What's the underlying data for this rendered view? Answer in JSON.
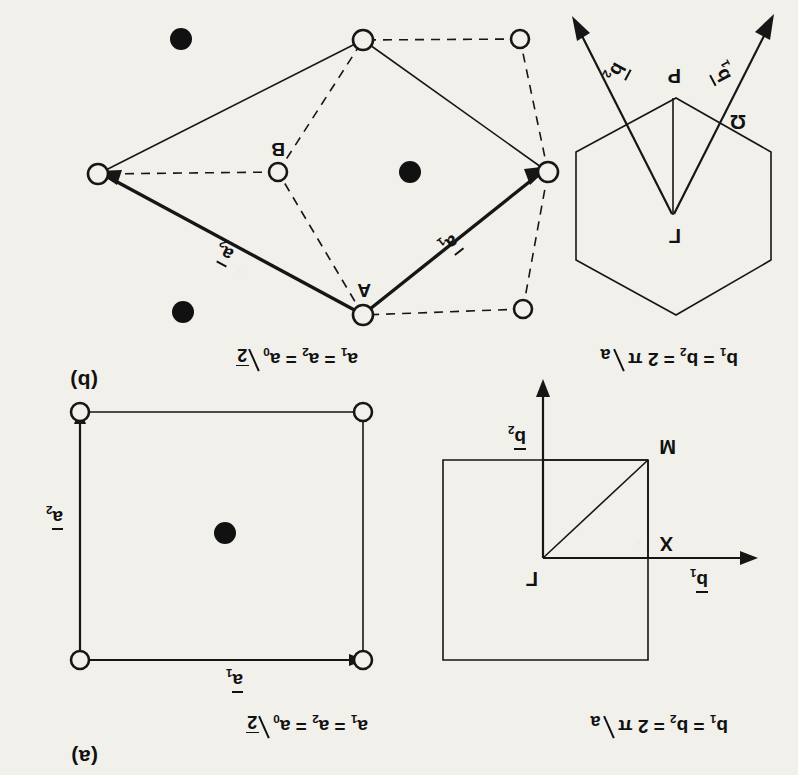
{
  "figure": {
    "orientation": "rotated-180",
    "ink_color": "#161616",
    "paper_color": "#f1f0eb"
  },
  "panels": [
    {
      "id": "a",
      "label": "(a)",
      "real_space": {
        "equation_plain": "a1 = a2 = a0/√2",
        "eq_lhs": "a",
        "eq_sub1": "1",
        "eq_eq1": " = a",
        "eq_sub2": "2",
        "eq_eq2": " = a",
        "eq_sub3": "0",
        "frac_num": "2",
        "frac_den": "",
        "radicand": "2",
        "vectors": [
          {
            "name": "a1",
            "label_base": "a",
            "label_sub": "1",
            "direction": "left"
          },
          {
            "name": "a2",
            "label_base": "a",
            "label_sub": "2",
            "direction": "down"
          }
        ],
        "atoms": {
          "open_count": 4,
          "filled_count": 1,
          "description": "square primitive cell, corner atoms open, centre atom filled"
        }
      },
      "brillouin_zone": {
        "equation_plain": "b1 = b2 = 2π/a",
        "eq_lhs": "b",
        "eq_sub1": "1",
        "eq_eq1": " = b",
        "eq_sub2": "2",
        "eq_eq2": " = 2 π",
        "eq_den": "a",
        "shape": "square",
        "symmetry_points": [
          {
            "name": "gamma",
            "label": "Γ"
          },
          {
            "name": "x",
            "label": "X"
          },
          {
            "name": "m",
            "label": "M"
          }
        ],
        "vectors": [
          {
            "name": "b1",
            "label_base": "b",
            "label_sub": "1",
            "direction": "left"
          },
          {
            "name": "b2",
            "label_base": "b",
            "label_sub": "2",
            "direction": "down"
          }
        ]
      }
    },
    {
      "id": "b",
      "label": "(b)",
      "real_space": {
        "equation_plain": "a1 = a2 = a0/√2",
        "eq_lhs": "a",
        "eq_sub1": "1",
        "eq_eq1": " = a",
        "eq_sub2": "2",
        "eq_eq2": " = a",
        "eq_sub3": "0",
        "radicand": "2",
        "vectors": [
          {
            "name": "a1",
            "label_base": "a",
            "label_sub": "1",
            "direction": "upper-right"
          },
          {
            "name": "a2",
            "label_base": "a",
            "label_sub": "2",
            "direction": "lower-right"
          }
        ],
        "atom_labels": [
          {
            "name": "atom-a",
            "label": "A"
          },
          {
            "name": "atom-b",
            "label": "B"
          }
        ],
        "atoms": {
          "open_count": 7,
          "filled_count": 3,
          "description": "rhombic primitive cell with A and B open atoms and filled second-layer atoms"
        }
      },
      "brillouin_zone": {
        "equation_plain": "b1 = b2 = 2π/a",
        "eq_lhs": "b",
        "eq_sub1": "1",
        "eq_eq1": " = b",
        "eq_sub2": "2",
        "eq_eq2": " = 2 π",
        "eq_den": "a",
        "shape": "hexagon",
        "symmetry_points": [
          {
            "name": "gamma",
            "label": "Γ"
          },
          {
            "name": "k",
            "label": "Ω"
          },
          {
            "name": "p",
            "label": "P"
          }
        ],
        "vectors": [
          {
            "name": "b1",
            "label_base": "b",
            "label_sub": "1",
            "direction": "lower-left"
          },
          {
            "name": "b2",
            "label_base": "b",
            "label_sub": "2",
            "direction": "lower-right"
          }
        ]
      }
    }
  ]
}
